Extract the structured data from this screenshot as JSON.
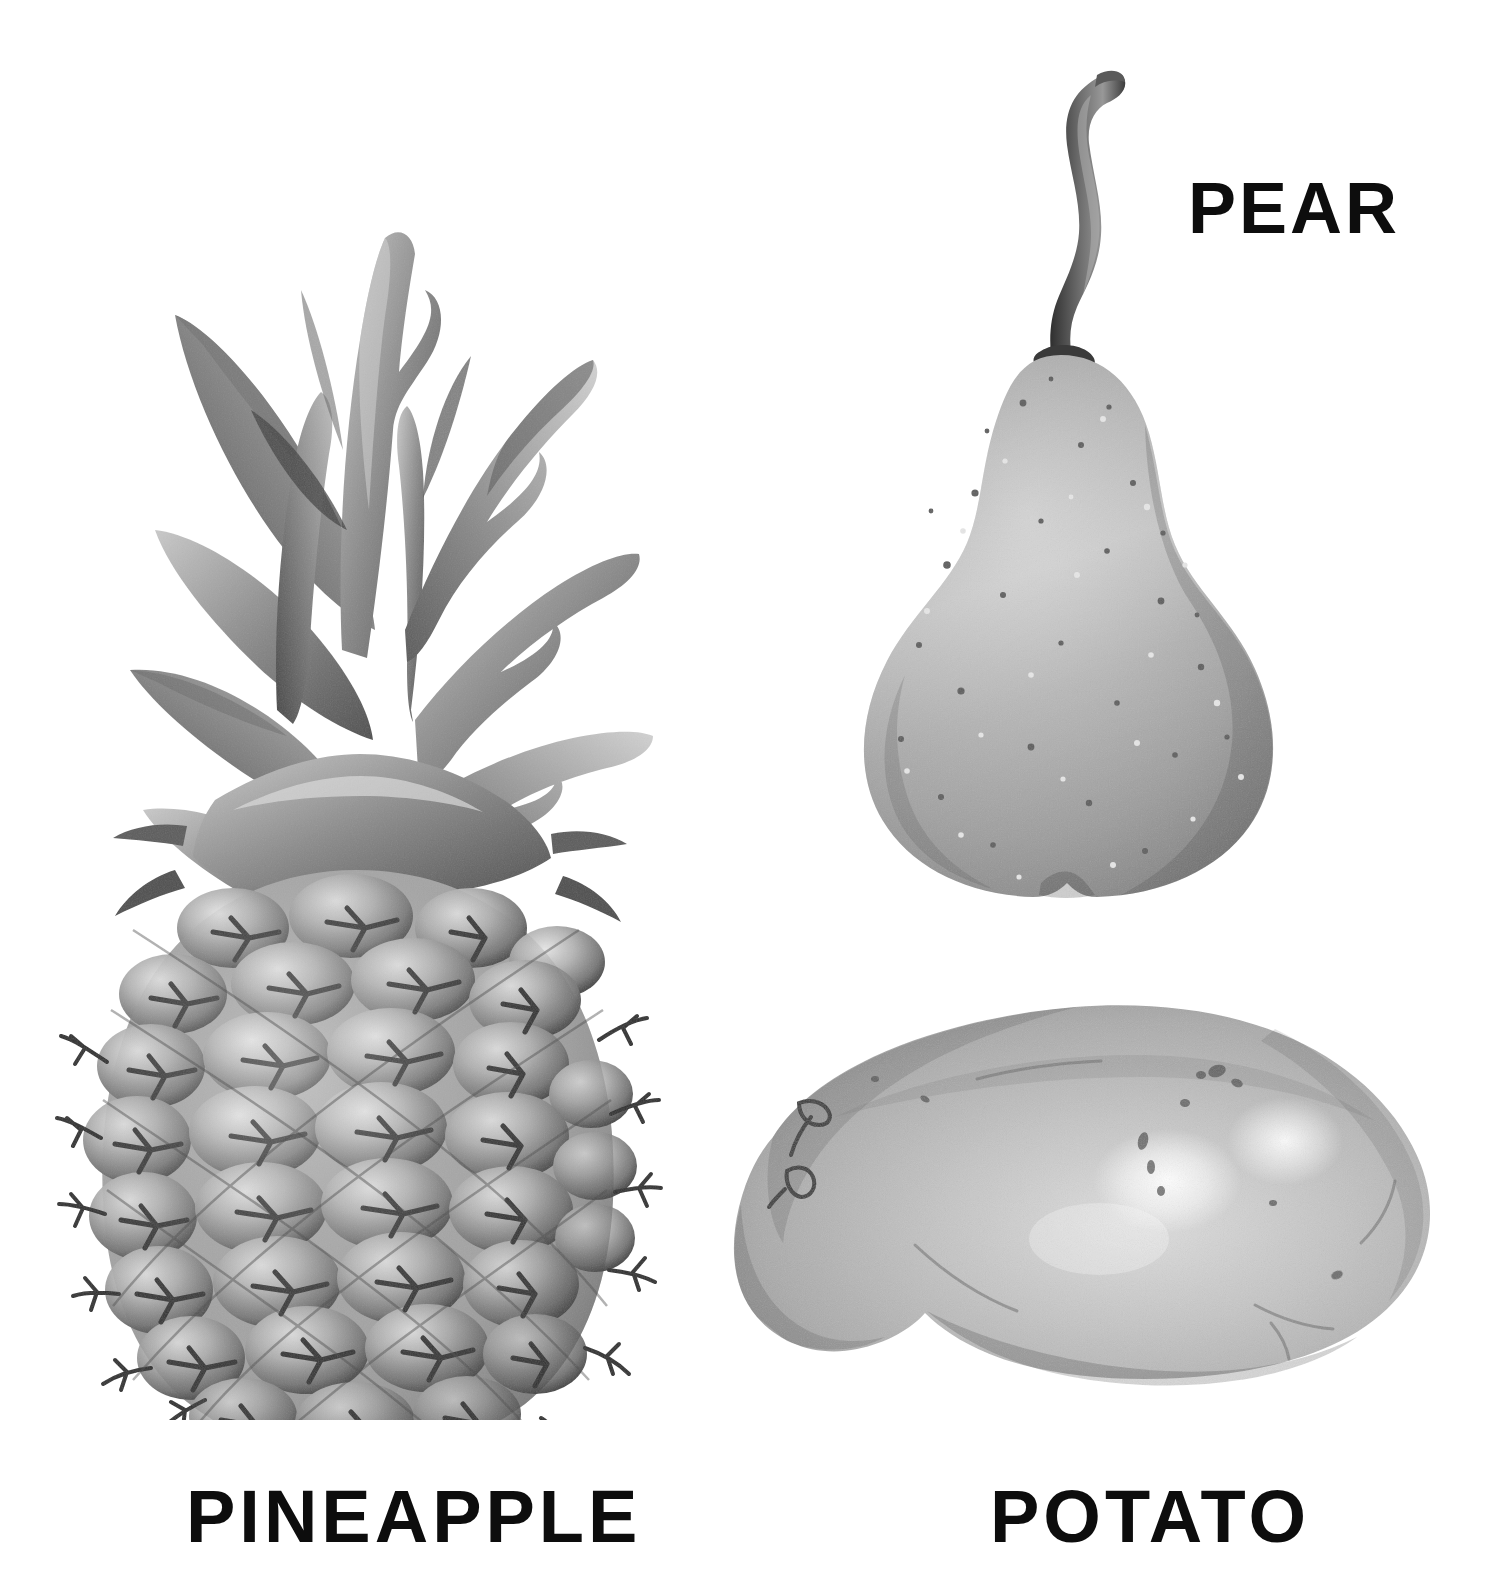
{
  "page": {
    "background_color": "#ffffff",
    "width": 1501,
    "height": 1575,
    "style": "grayscale botanical watercolor illustration plate",
    "item_count": 3
  },
  "labels": {
    "pear": "PEAR",
    "pineapple": "PINEAPPLE",
    "potato": "POTATO",
    "text_color": "#0d0d0d"
  },
  "illustrations": [
    {
      "id": "pineapple",
      "name": "pineapple",
      "label": "PINEAPPLE",
      "label_position": "bottom",
      "bounds": {
        "x": 70,
        "y": 120,
        "width": 585,
        "height": 1280
      },
      "description": "Whole upright pineapple with spiky crown of long pointed leaves above a hexagonally scaled body, each scale bearing a dark star-shaped bristle",
      "colors": {
        "leaf_light": "#b9b9b9",
        "leaf_mid": "#8d8d8d",
        "leaf_dark": "#4a4a4a",
        "body_light": "#d6d6d6",
        "body_mid": "#9e9e9e",
        "body_dark": "#4f4f4f",
        "outline": "#2b2b2b"
      },
      "crown_leaf_count": 17,
      "scale_rows": 9
    },
    {
      "id": "pear",
      "name": "pear",
      "label": "PEAR",
      "label_position": "right",
      "bounds": {
        "x": 862,
        "y": 65,
        "width": 433,
        "height": 835
      },
      "description": "Single bell-shaped pear with a long curved S-shaped woody stem, body speckled with light and dark lenticels and a soft notch at the base",
      "colors": {
        "body_light": "#bcbcbc",
        "body_mid": "#9d9d9d",
        "body_dark": "#7e7e7e",
        "stem_light": "#8a8a8a",
        "stem_dark": "#3a3a3a",
        "outline": "#6a6a6a"
      }
    },
    {
      "id": "potato",
      "name": "potato",
      "label": "POTATO",
      "label_position": "bottom",
      "bounds": {
        "x": 733,
        "y": 990,
        "width": 699,
        "height": 410
      },
      "description": "Single oblong kidney-shaped potato lying horizontally, mottled skin with bright specular highlights on the lower right and small dark eyes near the left end",
      "colors": {
        "body_light": "#d8d8d8",
        "body_mid": "#b4b4b4",
        "body_dark": "#8e8e8e",
        "highlight": "#fcfcfc",
        "eye_dark": "#3b3b3b",
        "outline": "#7a7a7a"
      }
    }
  ]
}
